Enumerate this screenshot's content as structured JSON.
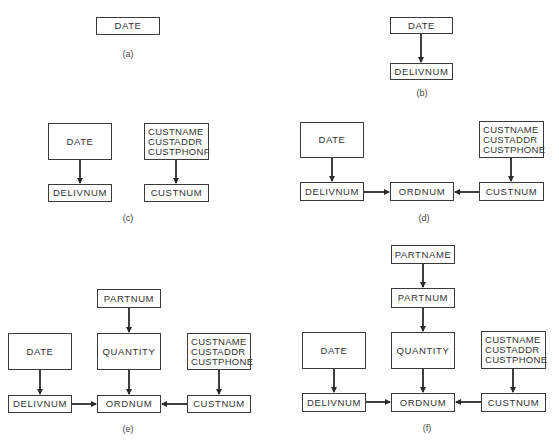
{
  "panels": {
    "a": {
      "caption": "(a)",
      "date": "DATE"
    },
    "b": {
      "caption": "(b)",
      "date": "DATE",
      "delivnum": "DELIVNUM"
    },
    "c": {
      "caption": "(c)",
      "date": "DATE",
      "delivnum": "DELIVNUM",
      "cust_attrs": [
        "CUSTNAME",
        "CUSTADDR",
        "CUSTPHONF"
      ],
      "custnum": "CUSTNUM"
    },
    "d": {
      "caption": "(d)",
      "date": "DATE",
      "delivnum": "DELIVNUM",
      "ordnum": "ORDNUM",
      "cust_attrs": [
        "CUSTNAME",
        "CUSTADDR",
        "CUSTPHONE"
      ],
      "custnum": "CUSTNUM"
    },
    "e": {
      "caption": "(e)",
      "partnum": "PARTNUM",
      "date": "DATE",
      "quantity": "QUANTITY",
      "cust_attrs": [
        "CUSTNAME",
        "CUSTADDR",
        "CUSTPHONE"
      ],
      "delivnum": "DELIVNUM",
      "ordnum": "ORDNUM",
      "custnum": "CUSTNUM"
    },
    "f": {
      "caption": "(f)",
      "partname": "PARTNAME",
      "partnum": "PARTNUM",
      "date": "DATE",
      "quantity": "QUANTITY",
      "cust_attrs": [
        "CUSTNAME",
        "CUSTADDR",
        "CUSTPHONE"
      ],
      "delivnum": "DELIVNUM",
      "ordnum": "ORDNUM",
      "custnum": "CUSTNUM"
    }
  }
}
